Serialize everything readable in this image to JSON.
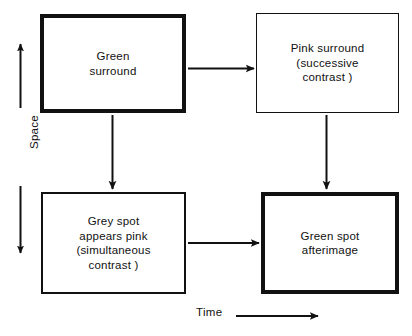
{
  "figure": {
    "background_color": "#ffffff",
    "ink_color": "#111111",
    "axes": {
      "vertical": {
        "label": "Space",
        "arrow_up_icon": "arrow-up-icon",
        "arrow_down_icon": "arrow-down-icon"
      },
      "horizontal": {
        "label": "Time",
        "arrow_right_icon": "arrow-right-icon"
      }
    },
    "nodes": [
      {
        "id": "green-surround",
        "label": "Green\nsurround",
        "border_weight": "thick"
      },
      {
        "id": "pink-surround",
        "label": "Pink surround\n(successive\ncontrast )",
        "border_weight": "thin"
      },
      {
        "id": "grey-spot",
        "label": "Grey spot\nappears pink\n(simultaneous\ncontrast )",
        "border_weight": "medium"
      },
      {
        "id": "green-afterimage",
        "label": "Green spot\nafterimage",
        "border_weight": "thick"
      }
    ],
    "connectors": [
      {
        "id": "green-surround-to-pink-surround",
        "direction": "right"
      },
      {
        "id": "green-surround-to-grey-spot",
        "direction": "down"
      },
      {
        "id": "pink-surround-to-green-afterimage",
        "direction": "down"
      },
      {
        "id": "grey-spot-to-green-afterimage",
        "direction": "right"
      }
    ]
  }
}
